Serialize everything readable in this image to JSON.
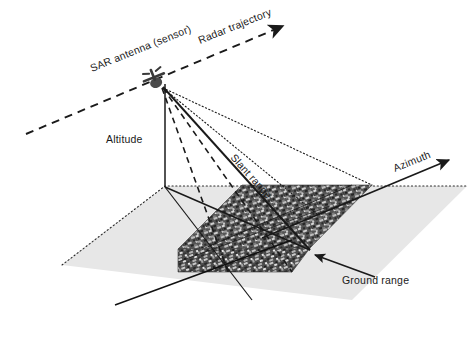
{
  "figure": {
    "background_color": "#ffffff",
    "ink_color": "#1a1a1a"
  },
  "labels": {
    "sensor": "SAR antenna (sensor)",
    "trajectory": "Radar trajectory",
    "altitude": "Altitude",
    "slant_range": "Slant range",
    "azimuth": "Azimuth",
    "ground_range": "Ground range"
  },
  "elements": {
    "ground_plane": {
      "name": "ground-plane",
      "fill": "#e6e6e6",
      "edge_style": "dotted"
    },
    "image_swath": {
      "name": "sar-image-swath",
      "fill": "#4a4a4a",
      "description": "textured SAR image strip"
    },
    "antenna_icon": {
      "name": "sar-antenna-icon",
      "glyph": "satellite"
    },
    "beam_lines": {
      "near_edge": "dashed",
      "far_edge": "dashed",
      "slant_ray": "solid",
      "outer_rays": "dotted"
    },
    "arrows": {
      "trajectory": "dashed-arrow",
      "azimuth": "solid-arrow",
      "ground_range": "solid-arrow"
    }
  }
}
